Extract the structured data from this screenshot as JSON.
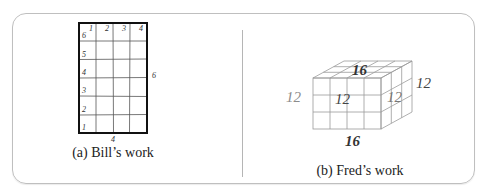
{
  "figure": {
    "panel_a": {
      "caption": "(a) Bill’s work",
      "grid": {
        "columns": 4,
        "rows": 6
      },
      "top_labels": [
        "1",
        "2",
        "3",
        "4"
      ],
      "left_labels": [
        "6",
        "5",
        "4",
        "3",
        "2",
        "1"
      ],
      "right_dimension": "6",
      "bottom_dimension": "4"
    },
    "panel_b": {
      "caption": "(b) Fred’s work",
      "prism": {
        "width_units": 4,
        "height_units": 3,
        "depth_units": 3
      },
      "labels": {
        "top": "16",
        "bottom": "16",
        "left": "12",
        "front": "12",
        "side": "12",
        "right": "12"
      }
    },
    "colors": {
      "frame_border": "#bfbfbf",
      "grid_line": "#333333",
      "grid_outer": "#111111",
      "prism_line": "#9a9a9a",
      "label_dark": "#333333",
      "label_light": "#8c8c8c"
    }
  }
}
